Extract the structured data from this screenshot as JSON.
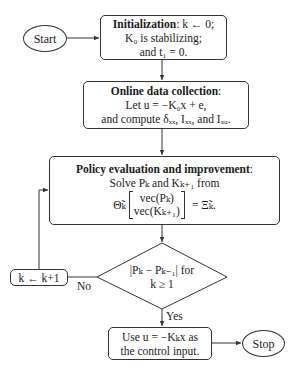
{
  "nodes": {
    "start": {
      "label": "Start"
    },
    "init": {
      "title": "Initialization",
      "line1_rest": ": k ← 0;",
      "line2": "K₀ is stabilizing;",
      "line3": "and t₁  =  0."
    },
    "online": {
      "title": "Online data collection",
      "title_suffix": ":",
      "line2": "Let u  =  −K₀x + e,",
      "line3": "and compute δₓₓ, Iₓₓ, and Iₓᵤ."
    },
    "policy": {
      "title": "Policy evaluation and improvement",
      "title_suffix": ":",
      "line2": "Solve Pₖ and Kₖ₊₁ from",
      "eq_lhs": "Θ̃ₖ",
      "eq_vec_top": "vec(Pₖ)",
      "eq_vec_bottom": "vec(Kₖ₊₁)",
      "eq_rhs": "=  Ξ̃ₖ."
    },
    "decision": {
      "line1": "|Pₖ − Pₖ₋₁| for",
      "line2": "k ≥ 1"
    },
    "increment": {
      "label": "k ← k+1"
    },
    "use": {
      "line1": "Use u = −Kₖx as",
      "line2": "the control input."
    },
    "stop": {
      "label": "Stop"
    }
  },
  "edge_labels": {
    "no": "No",
    "yes": "Yes"
  },
  "colors": {
    "stroke": "#333333",
    "text": "#1a1a1a",
    "background": "#ffffff"
  }
}
